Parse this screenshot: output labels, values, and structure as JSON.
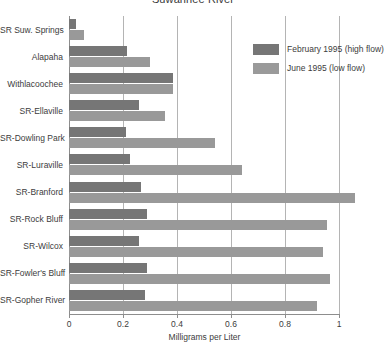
{
  "chart_data": {
    "type": "bar",
    "orientation": "horizontal",
    "title": "Suwannee River",
    "xlabel": "Milligrams per Liter",
    "ylabel": "",
    "xlim": [
      0,
      1.0
    ],
    "xticks": [
      0,
      0.2,
      0.4,
      0.6,
      0.8,
      1
    ],
    "xtick_labels": [
      "0",
      "0.2",
      "0.4",
      "0.6",
      "0.8",
      "1"
    ],
    "grid": "vertical",
    "legend_position": "top-right",
    "categories": [
      "SR Suw. Springs",
      "Alapaha",
      "Withlacoochee",
      "SR-Ellaville",
      "SR-Dowling Park",
      "SR-Luraville",
      "SR-Branford",
      "SR-Rock Bluff",
      "SR-Wilcox",
      "SR-Fowler's Bluff",
      "SR-Gopher River"
    ],
    "series": [
      {
        "name": "February 1995 (high flow)",
        "color": "#767676",
        "values": [
          0.025,
          0.215,
          0.385,
          0.26,
          0.21,
          0.225,
          0.265,
          0.29,
          0.26,
          0.29,
          0.28
        ]
      },
      {
        "name": "June 1995 (low flow)",
        "color": "#9a9a9a",
        "values": [
          0.055,
          0.3,
          0.385,
          0.355,
          0.54,
          0.64,
          1.06,
          0.955,
          0.94,
          0.965,
          0.92
        ]
      }
    ]
  },
  "legend": {
    "entries": [
      {
        "label": "February 1995 (high flow)"
      },
      {
        "label": "June 1995 (low flow)"
      }
    ]
  }
}
